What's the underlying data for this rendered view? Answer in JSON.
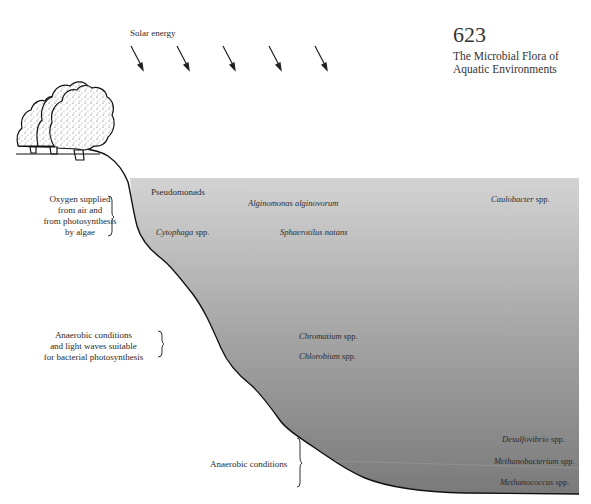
{
  "page": {
    "number": "623",
    "title_line1": "The Microbial Flora of",
    "title_line2": "Aquatic Environments"
  },
  "figure": {
    "solar": {
      "label": "Solar energy",
      "arrow_count": 5,
      "icon": "sun-ray-arrow-icon"
    },
    "land_icon": "trees-icon",
    "water_gradient": {
      "top_color": "#d3d3d3",
      "bottom_color": "#7a7a7a"
    },
    "conditions": [
      {
        "lines": [
          "Oxygen supplied",
          "from air and",
          "from photosynthesis",
          "by algae"
        ]
      },
      {
        "lines": [
          "Anaerobic conditions",
          "and light waves suitable",
          "for bacterial photosynthesis"
        ]
      },
      {
        "lines": [
          "Anaerobic conditions"
        ]
      }
    ],
    "organisms": {
      "pseudomonads": "Pseudomonads",
      "alginomonas": "Alginomonas alginovorum",
      "caulobacter_genus": "Caulobacter",
      "cytophaga_genus": "Cytophaga",
      "sphaerotilus": "Sphaerotilus natans",
      "chromatium_genus": "Chromatium",
      "chlorobium_genus": "Chlorobium",
      "desulfovibrio_genus": "Desulfovibrio",
      "methanobacterium_genus": "Methanobacterium",
      "methanococcus_genus": "Methanococcus",
      "spp": "spp."
    }
  }
}
